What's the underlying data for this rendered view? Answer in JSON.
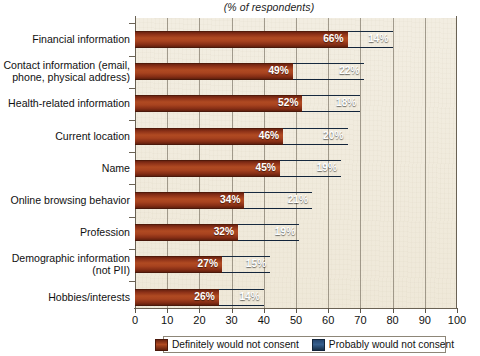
{
  "chart_data": {
    "type": "bar",
    "orientation": "horizontal",
    "stacked": true,
    "title": "(% of respondents)",
    "xlabel": "",
    "ylabel": "",
    "xlim": [
      0,
      100
    ],
    "xticks": [
      0,
      10,
      20,
      30,
      40,
      50,
      60,
      70,
      80,
      90,
      100
    ],
    "grid": true,
    "legend_position": "bottom",
    "categories": [
      "Financial information",
      "Contact information (email, phone, physical address)",
      "Health-related information",
      "Current location",
      "Name",
      "Online browsing behavior",
      "Profession",
      "Demographic information (not PII)",
      "Hobbies/interests"
    ],
    "category_lines": [
      [
        "Financial information"
      ],
      [
        "Contact information (email,",
        "phone, physical address)"
      ],
      [
        "Health-related information"
      ],
      [
        "Current location"
      ],
      [
        "Name"
      ],
      [
        "Online browsing behavior"
      ],
      [
        "Profession"
      ],
      [
        "Demographic information",
        "(not PII)"
      ],
      [
        "Hobbies/interests"
      ]
    ],
    "series": [
      {
        "name": "Definitely would not consent",
        "color": "#a8431f",
        "values": [
          66,
          49,
          52,
          46,
          45,
          34,
          32,
          27,
          26
        ],
        "labels": [
          "66%",
          "49%",
          "52%",
          "46%",
          "45%",
          "34%",
          "32%",
          "27%",
          "26%"
        ]
      },
      {
        "name": "Probably would not consent",
        "color": "#33577f",
        "values": [
          14,
          22,
          18,
          20,
          19,
          21,
          19,
          15,
          14
        ],
        "labels": [
          "14%",
          "22%",
          "18%",
          "20%",
          "19%",
          "21%",
          "19%",
          "15%",
          "14%"
        ]
      }
    ],
    "totals": [
      80,
      71,
      70,
      66,
      64,
      55,
      51,
      42,
      40
    ]
  },
  "legend": {
    "items": [
      {
        "label": "Definitely would not consent",
        "swatch": "red"
      },
      {
        "label": "Probably would not consent",
        "swatch": "blue"
      }
    ]
  },
  "axis": {
    "tick_labels": [
      "0",
      "10",
      "20",
      "30",
      "40",
      "50",
      "60",
      "70",
      "80",
      "90",
      "100"
    ]
  },
  "colors": {
    "plot_background": "#efe9da",
    "axis": "#6a6254",
    "series_definitely": "#a8431f",
    "series_probably": "#33577f",
    "label_text": "#111111",
    "value_text": "#ffffff"
  }
}
